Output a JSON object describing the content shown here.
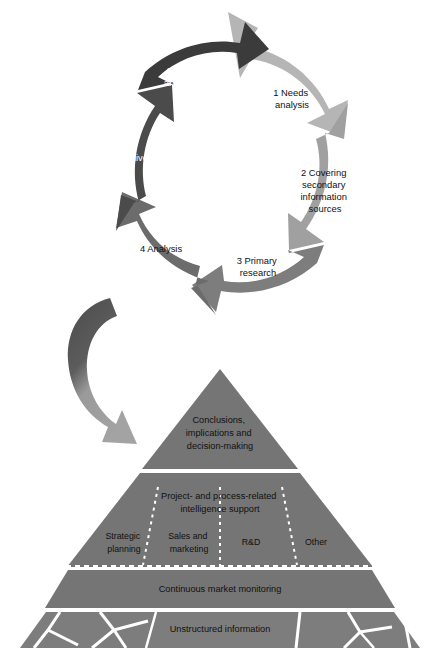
{
  "figure": {
    "background_color": "#ffffff"
  },
  "cycle": {
    "name": "market-intelligence-cycle",
    "center_hole_color": "#ffffff",
    "segments": [
      {
        "id": "segment-1",
        "number": "1",
        "label": "1 Needs\nanalysis",
        "lines": [
          "1 Needs",
          "analysis"
        ],
        "color": "#b5b5b5",
        "text_color": "#111111"
      },
      {
        "id": "segment-2",
        "number": "2",
        "label": "2 Covering secondary information sources",
        "lines": [
          "2 Covering",
          "secondary",
          "information",
          "sources"
        ],
        "color": "#a0a0a0",
        "text_color": "#111111"
      },
      {
        "id": "segment-3",
        "number": "3",
        "label": "3 Primary research",
        "lines": [
          "3 Primary",
          "research"
        ],
        "color": "#7d7d7d",
        "text_color": "#111111"
      },
      {
        "id": "segment-4",
        "number": "4",
        "label": "4 Analysis",
        "lines": [
          "4 Analysis"
        ],
        "color": "#6c6c6c",
        "text_color": "#111111"
      },
      {
        "id": "segment-5",
        "number": "5",
        "label": "5 Delivery",
        "lines": [
          "5 Delivery"
        ],
        "color": "#4b4b4b",
        "text_color": "#ffffff"
      },
      {
        "id": "segment-6",
        "number": "6",
        "label": "6 Utilization and feedback",
        "lines": [
          "6 Utilization",
          "and feedback"
        ],
        "color": "#3b3b3b",
        "text_color": "#ffffff"
      }
    ]
  },
  "connector": {
    "name": "curved-down-arrow",
    "from": "cycle",
    "to": "pyramid",
    "color_start": "#4b4b4b",
    "color_end": "#9a9a9a"
  },
  "pyramid": {
    "name": "intelligence-pyramid",
    "fill_color": "#757575",
    "divider_color": "#ffffff",
    "layers": [
      {
        "id": "layer-top",
        "lines": [
          "Conclusions,",
          "implications and",
          "decision-making"
        ],
        "text": "Conclusions, implications and decision-making"
      },
      {
        "id": "layer-middle",
        "lines": [
          "Project- and process-related",
          "intelligence support"
        ],
        "text": "Project- and process-related intelligence support",
        "columns": [
          {
            "id": "column-strategic-planning",
            "lines": [
              "Strategic",
              "planning"
            ],
            "text": "Strategic planning"
          },
          {
            "id": "column-sales-marketing",
            "lines": [
              "Sales and",
              "marketing"
            ],
            "text": "Sales and marketing"
          },
          {
            "id": "column-rd",
            "lines": [
              "R&D"
            ],
            "text": "R&D"
          },
          {
            "id": "column-other",
            "lines": [
              "Other"
            ],
            "text": "Other"
          }
        ]
      },
      {
        "id": "layer-monitoring",
        "lines": [
          "Continuous market monitoring"
        ],
        "text": "Continuous market monitoring"
      },
      {
        "id": "layer-unstructured",
        "lines": [
          "Unstructured information"
        ],
        "text": "Unstructured information"
      }
    ]
  }
}
